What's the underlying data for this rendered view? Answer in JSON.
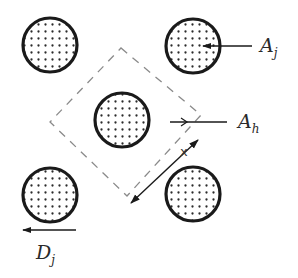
{
  "diagram": {
    "colors": {
      "stroke": "#1a1a1a",
      "dots": "#2b2b2b",
      "dashed": "#8a8a8a",
      "background": "#ffffff"
    },
    "circles": [
      {
        "id": "top-left",
        "cx": 50,
        "cy": 45,
        "r": 27
      },
      {
        "id": "top-right",
        "cx": 193,
        "cy": 46,
        "r": 27
      },
      {
        "id": "center",
        "cx": 122,
        "cy": 120,
        "r": 27
      },
      {
        "id": "bottom-left",
        "cx": 50,
        "cy": 195,
        "r": 27
      },
      {
        "id": "bottom-right",
        "cx": 193,
        "cy": 194,
        "r": 27
      }
    ],
    "unit_cell": {
      "shape": "dashed-diamond",
      "points": [
        [
          121,
          48
        ],
        [
          201,
          115
        ],
        [
          127,
          196
        ],
        [
          50,
          122
        ]
      ]
    },
    "labels": {
      "a_j": {
        "base": "A",
        "sub": "j"
      },
      "a_h": {
        "base": "A",
        "sub": "h"
      },
      "d_j": {
        "base": "D",
        "sub": "j"
      },
      "x": "x"
    }
  }
}
